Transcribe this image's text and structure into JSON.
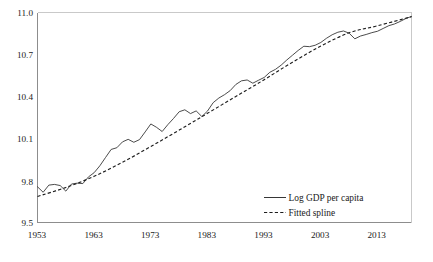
{
  "chart_data": {
    "type": "line",
    "title": "",
    "subtitle": "",
    "xlabel": "",
    "ylabel": "",
    "xlim": [
      1953,
      2019
    ],
    "ylim": [
      9.5,
      11.0
    ],
    "grid": false,
    "legend_position": "bottom-right",
    "x_ticks": [
      "1953",
      "1963",
      "1973",
      "1983",
      "1993",
      "2003",
      "2013"
    ],
    "x_tick_values": [
      1953,
      1963,
      1973,
      1983,
      1993,
      2003,
      2013
    ],
    "y_ticks": [
      "9.5",
      "9.8",
      "10.1",
      "10.4",
      "10.7",
      "11.0"
    ],
    "y_tick_values": [
      9.5,
      9.8,
      10.1,
      10.4,
      10.7,
      11.0
    ],
    "legend": [
      {
        "label": "Log GDP per capita",
        "style": "solid"
      },
      {
        "label": "Fitted spline",
        "style": "dashed"
      }
    ],
    "series": [
      {
        "name": "Log GDP per capita",
        "style": "solid",
        "x": [
          1953,
          1954,
          1955,
          1956,
          1957,
          1958,
          1959,
          1960,
          1961,
          1962,
          1963,
          1964,
          1965,
          1966,
          1967,
          1968,
          1969,
          1970,
          1971,
          1972,
          1973,
          1974,
          1975,
          1976,
          1977,
          1978,
          1979,
          1980,
          1981,
          1982,
          1983,
          1984,
          1985,
          1986,
          1987,
          1988,
          1989,
          1990,
          1991,
          1992,
          1993,
          1994,
          1995,
          1996,
          1997,
          1998,
          1999,
          2000,
          2001,
          2002,
          2003,
          2004,
          2005,
          2006,
          2007,
          2008,
          2009,
          2010,
          2011,
          2012,
          2013,
          2014,
          2015,
          2016,
          2017,
          2018,
          2019
        ],
        "values": [
          9.755,
          9.716,
          9.767,
          9.772,
          9.764,
          9.724,
          9.775,
          9.781,
          9.778,
          9.826,
          9.856,
          9.905,
          9.964,
          10.022,
          10.034,
          10.076,
          10.094,
          10.073,
          10.092,
          10.147,
          10.204,
          10.18,
          10.15,
          10.199,
          10.243,
          10.291,
          10.305,
          10.278,
          10.297,
          10.257,
          10.296,
          10.356,
          10.389,
          10.413,
          10.442,
          10.486,
          10.512,
          10.518,
          10.495,
          10.516,
          10.536,
          10.573,
          10.594,
          10.624,
          10.661,
          10.695,
          10.729,
          10.759,
          10.756,
          10.766,
          10.786,
          10.816,
          10.841,
          10.859,
          10.868,
          10.852,
          10.812,
          10.832,
          10.843,
          10.856,
          10.866,
          10.886,
          10.906,
          10.918,
          10.936,
          10.957,
          10.972
        ]
      },
      {
        "name": "Fitted spline",
        "style": "dashed",
        "x": [
          1953,
          1958,
          1963,
          1968,
          1973,
          1978,
          1983,
          1988,
          1993,
          1998,
          2003,
          2008,
          2013,
          2019
        ],
        "values": [
          9.686,
          9.75,
          9.83,
          9.93,
          10.043,
          10.16,
          10.28,
          10.4,
          10.52,
          10.645,
          10.76,
          10.855,
          10.905,
          10.97
        ]
      }
    ]
  },
  "axes": {
    "frame_color": "#8d8d8d"
  }
}
